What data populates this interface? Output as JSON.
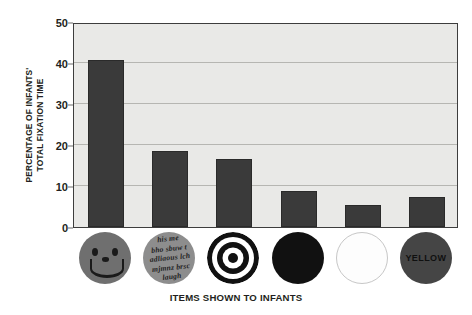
{
  "chart_data": {
    "type": "bar",
    "title": "",
    "xlabel": "ITEMS SHOWN TO INFANTS",
    "ylabel": "PERCENTAGE OF INFANTS' TOTAL FIXATION TIME",
    "ylabel_line1": "PERCENTAGE OF INFANTS'",
    "ylabel_line2": "TOTAL FIXATION TIME",
    "ylim": [
      0,
      50
    ],
    "yticks": [
      0,
      10,
      20,
      30,
      40,
      50
    ],
    "ytick_labels": [
      "0",
      "10",
      "20",
      "30",
      "40",
      "50"
    ],
    "grid": true,
    "legend": "none",
    "categories": [
      "face",
      "scrambled-face",
      "bullseye",
      "black-circle",
      "white-circle",
      "yellow-circle"
    ],
    "category_icons": [
      {
        "name": "face-icon",
        "kind": "smiley-face",
        "label": ""
      },
      {
        "name": "scrambled-face-icon",
        "kind": "scrambled-text-face",
        "label": "his me\nbho sbuw t\nadliaous lch\nmjmnz brsc\nlaugh"
      },
      {
        "name": "bullseye-icon",
        "kind": "concentric-rings",
        "label": ""
      },
      {
        "name": "black-circle-icon",
        "kind": "solid-dark-circle",
        "label": ""
      },
      {
        "name": "white-circle-icon",
        "kind": "outlined-white-circle",
        "label": ""
      },
      {
        "name": "yellow-circle-icon",
        "kind": "labelled-circle",
        "label": "YELLOW"
      }
    ],
    "values": [
      40.7,
      18.6,
      16.6,
      8.8,
      5.4,
      7.2
    ],
    "bar_color": "#3a3a3a",
    "plot_background": "#e9e9e7",
    "gridline_color": "#b6b6b2",
    "axis_color": "#3d3d3d"
  }
}
